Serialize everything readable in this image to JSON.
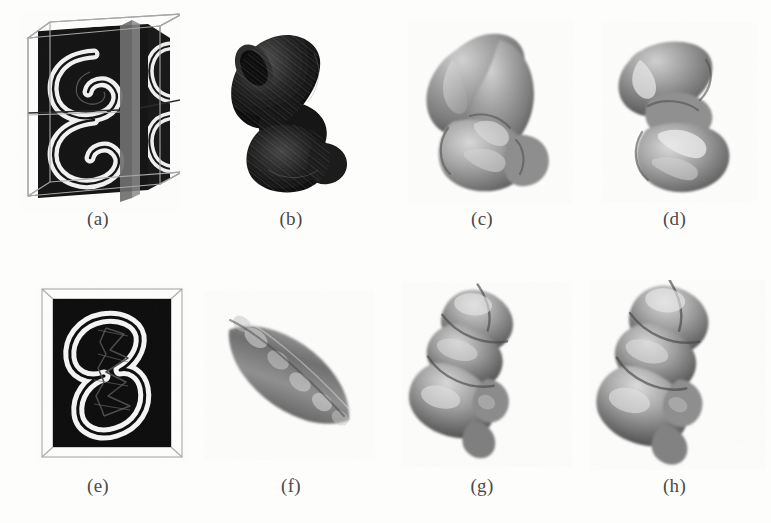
{
  "figure": {
    "kind": "scientific-figure",
    "layout": {
      "rows": 2,
      "cols": 4,
      "width": 771,
      "height": 523
    },
    "background_color": "#fdfdfc",
    "caption_color": "#4a4a4a"
  },
  "panels": [
    {
      "id": "a",
      "caption": "(a)",
      "type": "volume-box-slices",
      "description": "3D bounding box with two orthogonal cutting planes through a volumetric S-shaped (double-spiral) object rendered white on black",
      "colors": {
        "box_edge": "#9a9a9a",
        "slice_background": "#141414",
        "object": "#f2f2f2",
        "cut_plane": "#6e6e6e"
      }
    },
    {
      "id": "b",
      "caption": "(b)",
      "type": "iso-surface",
      "description": "Dark, heavily shaded S-shaped isosurface with visible triangular mesh texture",
      "colors": {
        "surface_light": "#5a5a5a",
        "surface_dark": "#111111"
      }
    },
    {
      "id": "c",
      "caption": "(c)",
      "type": "iso-surface",
      "description": "Smooth mid-grey deformable-model surface, bulky S/kidney shape",
      "colors": {
        "surface_light": "#c9c9c9",
        "surface_dark": "#6d6d6d"
      }
    },
    {
      "id": "d",
      "caption": "(d)",
      "type": "iso-surface",
      "description": "Slimmer S-curved tubular reconstruction, mid-grey shading",
      "colors": {
        "surface_light": "#cdcdcd",
        "surface_dark": "#676767"
      }
    },
    {
      "id": "e",
      "caption": "(e)",
      "type": "volume-box-slices",
      "description": "Front-facing slice in a thin 3D box: white spiral ring on black with a thin dark skeleton centreline overlaid",
      "colors": {
        "box_edge": "#a5a5a5",
        "slice_background": "#0d0d0d",
        "object": "#f4f4f4",
        "skeleton": "#3c3c3c"
      }
    },
    {
      "id": "f",
      "caption": "(f)",
      "type": "iso-surface",
      "description": "Elongated diagonal spindle / cigar-shaped initial model",
      "colors": {
        "surface_light": "#c4c4c4",
        "surface_dark": "#5e5e5e"
      }
    },
    {
      "id": "g",
      "caption": "(g)",
      "type": "iso-surface",
      "description": "Segmented lobed tubular surface, intermediate deformation stage",
      "colors": {
        "surface_light": "#c8c8c8",
        "surface_dark": "#606060"
      }
    },
    {
      "id": "h",
      "caption": "(h)",
      "type": "iso-surface",
      "description": "Segmented lobed tubular surface, final deformation stage, slightly fuller than (g)",
      "colors": {
        "surface_light": "#cbcbcb",
        "surface_dark": "#5d5d5d"
      }
    }
  ]
}
